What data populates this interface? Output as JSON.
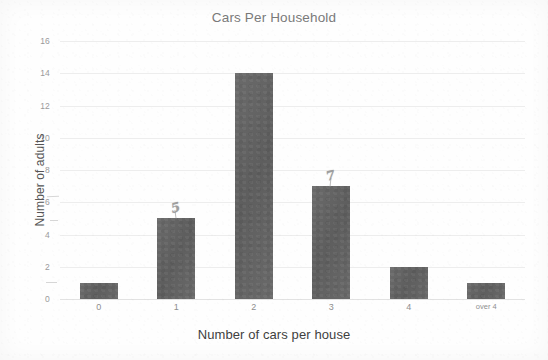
{
  "chart_data": {
    "type": "bar",
    "title": "Cars Per Household",
    "xlabel": "Number of cars per house",
    "ylabel": "Number of adults",
    "categories": [
      "0",
      "1",
      "2",
      "3",
      "4",
      "over 4"
    ],
    "values": [
      1,
      5,
      14,
      7,
      2,
      1
    ],
    "ylim": [
      0,
      16
    ],
    "yticks": [
      "0",
      "2",
      "4",
      "6",
      "8",
      "10",
      "12",
      "14",
      "16"
    ],
    "grid": true,
    "legend": "none",
    "bar_color": "#636363",
    "grid_color": "#ededed",
    "axis_text_color": "#8f8f8f",
    "title_color": "#7a7a7a",
    "annotations": [
      {
        "text": "5",
        "category": "1",
        "note": "handwritten pencil mark above bar"
      },
      {
        "text": "7",
        "category": "3",
        "note": "handwritten pencil mark above bar"
      }
    ]
  }
}
